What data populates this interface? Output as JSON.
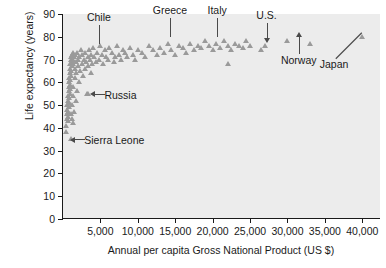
{
  "chart_data": {
    "type": "scatter",
    "title": "",
    "xlabel": "Annual per capita Gross National Product (US $)",
    "ylabel": "Life expectancy (years)",
    "xlim": [
      0,
      42500
    ],
    "ylim": [
      0,
      90
    ],
    "xticks": [
      5000,
      10000,
      15000,
      20000,
      25000,
      30000,
      35000,
      40000
    ],
    "xtick_labels": [
      "5,000",
      "10,000",
      "15,000",
      "20,000",
      "25,000",
      "30,000",
      "35,000",
      "40,000"
    ],
    "yticks": [
      0,
      10,
      20,
      30,
      40,
      50,
      60,
      70,
      80,
      90
    ],
    "ytick_labels": [
      "0",
      "10",
      "20",
      "30",
      "40",
      "50",
      "60",
      "70",
      "80",
      "90"
    ],
    "grid": false,
    "legend": "none",
    "marker": "triangle",
    "marker_color": "#9a9a9a",
    "plot_background": "#ececec",
    "points": [
      [
        400,
        38
      ],
      [
        450,
        41
      ],
      [
        500,
        44
      ],
      [
        520,
        46
      ],
      [
        560,
        48
      ],
      [
        600,
        50
      ],
      [
        620,
        43
      ],
      [
        650,
        52
      ],
      [
        680,
        45
      ],
      [
        700,
        54
      ],
      [
        720,
        47
      ],
      [
        740,
        56
      ],
      [
        760,
        49
      ],
      [
        780,
        58
      ],
      [
        800,
        51
      ],
      [
        820,
        60
      ],
      [
        840,
        53
      ],
      [
        860,
        62
      ],
      [
        880,
        55
      ],
      [
        900,
        64
      ],
      [
        920,
        57
      ],
      [
        940,
        66
      ],
      [
        960,
        59
      ],
      [
        980,
        68
      ],
      [
        1000,
        61
      ],
      [
        1020,
        70
      ],
      [
        1050,
        63
      ],
      [
        1080,
        71
      ],
      [
        1100,
        65
      ],
      [
        1120,
        46
      ],
      [
        1150,
        67
      ],
      [
        1180,
        72
      ],
      [
        1200,
        44
      ],
      [
        1220,
        69
      ],
      [
        1250,
        50
      ],
      [
        1280,
        73
      ],
      [
        1300,
        54
      ],
      [
        1320,
        68
      ],
      [
        1350,
        42
      ],
      [
        1380,
        70
      ],
      [
        1400,
        58
      ],
      [
        1450,
        71
      ],
      [
        1500,
        47
      ],
      [
        1550,
        66
      ],
      [
        1600,
        62
      ],
      [
        1650,
        72
      ],
      [
        1700,
        52
      ],
      [
        1750,
        69
      ],
      [
        1800,
        64
      ],
      [
        1850,
        73
      ],
      [
        1900,
        56
      ],
      [
        1950,
        67
      ],
      [
        2000,
        70
      ],
      [
        2100,
        60
      ],
      [
        2200,
        71
      ],
      [
        2300,
        65
      ],
      [
        2400,
        74
      ],
      [
        2500,
        68
      ],
      [
        2600,
        72
      ],
      [
        2700,
        63
      ],
      [
        2800,
        70
      ],
      [
        2900,
        66
      ],
      [
        3000,
        73
      ],
      [
        3100,
        69
      ],
      [
        3200,
        55
      ],
      [
        3300,
        71
      ],
      [
        3400,
        67
      ],
      [
        3500,
        74
      ],
      [
        3600,
        70
      ],
      [
        3700,
        64
      ],
      [
        3800,
        72
      ],
      [
        3900,
        68
      ],
      [
        4000,
        75
      ],
      [
        4200,
        71
      ],
      [
        4400,
        69
      ],
      [
        4600,
        73
      ],
      [
        4800,
        70
      ],
      [
        5000,
        76
      ],
      [
        5200,
        72
      ],
      [
        5400,
        68
      ],
      [
        5600,
        74
      ],
      [
        5800,
        71
      ],
      [
        6000,
        70
      ],
      [
        6200,
        75
      ],
      [
        6500,
        73
      ],
      [
        6800,
        69
      ],
      [
        7000,
        71
      ],
      [
        7200,
        76
      ],
      [
        7500,
        72
      ],
      [
        7800,
        70
      ],
      [
        8000,
        74
      ],
      [
        8300,
        73
      ],
      [
        8600,
        71
      ],
      [
        9000,
        75
      ],
      [
        9300,
        72
      ],
      [
        9600,
        70
      ],
      [
        10000,
        74
      ],
      [
        10500,
        73
      ],
      [
        11000,
        71
      ],
      [
        11500,
        76
      ],
      [
        12000,
        74
      ],
      [
        12500,
        72
      ],
      [
        13000,
        75
      ],
      [
        13500,
        73
      ],
      [
        14000,
        77
      ],
      [
        14500,
        74
      ],
      [
        15000,
        72
      ],
      [
        15500,
        76
      ],
      [
        16000,
        75
      ],
      [
        16500,
        73
      ],
      [
        17000,
        77
      ],
      [
        17500,
        74
      ],
      [
        18000,
        76
      ],
      [
        18500,
        75
      ],
      [
        19000,
        78
      ],
      [
        19500,
        76
      ],
      [
        20000,
        74
      ],
      [
        20500,
        77
      ],
      [
        21000,
        75
      ],
      [
        21500,
        78
      ],
      [
        22000,
        76
      ],
      [
        22500,
        74
      ],
      [
        23000,
        77
      ],
      [
        23500,
        76
      ],
      [
        24000,
        75
      ],
      [
        24500,
        78
      ],
      [
        25000,
        76
      ],
      [
        26500,
        74
      ],
      [
        27000,
        76
      ],
      [
        30000,
        78
      ],
      [
        33000,
        77
      ],
      [
        40000,
        80
      ],
      [
        1050,
        35
      ],
      [
        3400,
        55
      ],
      [
        22000,
        68
      ]
    ],
    "annotations": [
      {
        "label": "Chile",
        "country_x": 4800,
        "country_y": 75,
        "leader": "vertical"
      },
      {
        "label": "Greece",
        "country_x": 14300,
        "country_y": 78,
        "leader": "vertical"
      },
      {
        "label": "Italy",
        "country_x": 20600,
        "country_y": 78,
        "leader": "vertical"
      },
      {
        "label": "U.S.",
        "country_x": 27200,
        "country_y": 76,
        "leader": "arrow-down"
      },
      {
        "label": "Norway",
        "country_x": 31500,
        "country_y": 78,
        "leader": "arrow-up"
      },
      {
        "label": "Japan",
        "country_x": 40200,
        "country_y": 80,
        "leader": "diagonal"
      },
      {
        "label": "Russia",
        "country_x": 3400,
        "country_y": 55,
        "leader": "arrow-left"
      },
      {
        "label": "Sierra Leone",
        "country_x": 700,
        "country_y": 35,
        "leader": "arrow-left"
      }
    ]
  }
}
